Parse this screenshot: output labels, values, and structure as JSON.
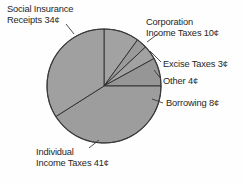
{
  "chart_data": {
    "type": "pie",
    "title": "",
    "subtitle": "",
    "xlabel": "",
    "ylabel": "",
    "unit": "¢",
    "total": 100,
    "legend_position": "none",
    "grid": false,
    "categories": [
      "Individual Income Taxes",
      "Social Insurance Receipts",
      "Corporation Income Taxes",
      "Excise Taxes",
      "Other",
      "Borrowing"
    ],
    "values": [
      41,
      34,
      10,
      3,
      4,
      8
    ],
    "slices": [
      {
        "name": "corporation-income-taxes",
        "label": "Corporation Income Taxes 10¢",
        "value": 10,
        "color": "#a2a2a2",
        "start_angle": 0,
        "end_angle": 36
      },
      {
        "name": "excise-taxes",
        "label": "Excise Taxes 3¢",
        "value": 3,
        "color": "#9a9a9a",
        "start_angle": 36,
        "end_angle": 46.8
      },
      {
        "name": "other",
        "label": "Other 4¢",
        "value": 4,
        "color": "#a2a2a2",
        "start_angle": 46.8,
        "end_angle": 61.2
      },
      {
        "name": "borrowing",
        "label": "Borrowing 8¢",
        "value": 8,
        "color": "#969696",
        "start_angle": 61.2,
        "end_angle": 90
      },
      {
        "name": "individual-income-taxes",
        "label": "Individual Income Taxes 41¢",
        "value": 41,
        "color": "#9d9d9d",
        "start_angle": 90,
        "end_angle": 237.6
      },
      {
        "name": "social-insurance-receipts",
        "label": "Social Insurance Receipts 34¢",
        "value": 34,
        "color": "#a0a0a0",
        "start_angle": 237.6,
        "end_angle": 360
      }
    ]
  },
  "labels": {
    "social_insurance": {
      "line1": "Social Insurance",
      "line2": "Receipts 34¢"
    },
    "corporation": {
      "line1": "Corporation",
      "line2": "Income Taxes 10¢"
    },
    "excise": {
      "line1": "Excise Taxes 3¢"
    },
    "other": {
      "line1": "Other 4¢"
    },
    "borrowing": {
      "line1": "Borrowing 8¢"
    },
    "individual": {
      "line1": "Individual",
      "line2": "Income Taxes 41¢"
    }
  },
  "colors": {
    "slice_fill": "#9d9d9d",
    "slice_stroke": "#2b2b2b",
    "text": "#262626",
    "background": "#fefefe"
  }
}
